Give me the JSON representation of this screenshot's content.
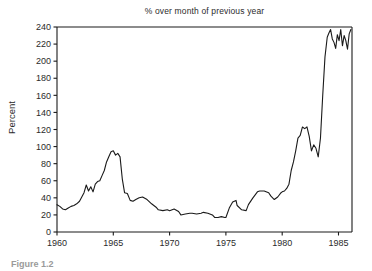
{
  "figure": {
    "caption": "Figure 1.2"
  },
  "chart_data": {
    "type": "line",
    "title": "% over month of previous year",
    "xlabel": "",
    "ylabel": "Percent",
    "xlim": [
      1960,
      1986.2
    ],
    "ylim": [
      0,
      240
    ],
    "grid": false,
    "legend": null,
    "xticks": [
      1960,
      1965,
      1970,
      1975,
      1980,
      1985
    ],
    "xtick_labels": [
      "1960",
      "1965",
      "1970",
      "1975",
      "1980",
      "1985"
    ],
    "yticks": [
      0,
      20,
      40,
      60,
      80,
      100,
      120,
      140,
      160,
      180,
      200,
      220,
      240
    ],
    "ytick_labels": [
      "0",
      "20",
      "40",
      "60",
      "80",
      "100",
      "120",
      "140",
      "160",
      "180",
      "200",
      "220",
      "240"
    ],
    "line_color": "#1a1a1a",
    "series": [
      {
        "name": "% over month of previous year",
        "x": [
          1960.0,
          1960.25,
          1960.5,
          1960.75,
          1961.0,
          1961.25,
          1961.5,
          1961.75,
          1962.0,
          1962.2,
          1962.4,
          1962.6,
          1962.8,
          1963.0,
          1963.2,
          1963.4,
          1963.6,
          1963.8,
          1964.0,
          1964.2,
          1964.4,
          1964.6,
          1964.8,
          1965.0,
          1965.2,
          1965.4,
          1965.6,
          1965.8,
          1966.0,
          1966.25,
          1966.5,
          1966.75,
          1967.0,
          1967.3,
          1967.6,
          1968.0,
          1968.4,
          1968.8,
          1969.0,
          1969.4,
          1969.8,
          1970.0,
          1970.4,
          1970.8,
          1971.0,
          1971.4,
          1971.8,
          1972.0,
          1972.4,
          1972.8,
          1973.0,
          1973.4,
          1973.8,
          1974.0,
          1974.3,
          1974.6,
          1974.9,
          1975.0,
          1975.3,
          1975.6,
          1975.9,
          1976.0,
          1976.4,
          1976.8,
          1977.0,
          1977.4,
          1977.8,
          1978.0,
          1978.4,
          1978.8,
          1979.0,
          1979.3,
          1979.6,
          1979.9,
          1980.0,
          1980.2,
          1980.4,
          1980.6,
          1980.8,
          1981.0,
          1981.2,
          1981.4,
          1981.6,
          1981.8,
          1982.0,
          1982.2,
          1982.4,
          1982.6,
          1982.8,
          1983.0,
          1983.2,
          1983.4,
          1983.6,
          1983.8,
          1984.0,
          1984.15,
          1984.3,
          1984.45,
          1984.6,
          1984.75,
          1984.9,
          1985.05,
          1985.2,
          1985.35,
          1985.5,
          1985.65,
          1985.8,
          1985.95,
          1986.1
        ],
        "y": [
          32,
          30,
          27,
          26,
          28,
          30,
          31,
          33,
          36,
          41,
          46,
          55,
          48,
          53,
          47,
          56,
          59,
          60,
          66,
          72,
          82,
          88,
          94,
          95,
          90,
          92,
          88,
          62,
          46,
          45,
          37,
          36,
          38,
          40,
          41,
          38,
          33,
          29,
          26,
          25,
          26,
          25,
          27,
          24,
          20,
          21,
          22,
          22,
          21,
          22,
          23,
          22,
          20,
          17,
          17,
          18,
          17,
          17,
          28,
          35,
          37,
          31,
          26,
          25,
          32,
          40,
          47,
          48,
          48,
          46,
          42,
          38,
          41,
          46,
          47,
          48,
          51,
          56,
          72,
          82,
          95,
          110,
          113,
          123,
          121,
          123,
          112,
          95,
          102,
          98,
          88,
          110,
          160,
          205,
          228,
          233,
          237,
          226,
          222,
          215,
          231,
          224,
          237,
          218,
          230,
          224,
          214,
          232,
          237
        ]
      }
    ]
  }
}
